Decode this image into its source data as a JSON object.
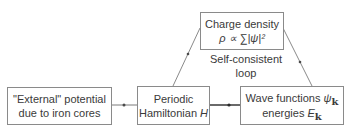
{
  "diagram": {
    "nodes": {
      "charge": {
        "line1": "Charge density",
        "line2": "ρ ∝ ∑|ψ|²"
      },
      "external": {
        "line1": "\"External\" potential",
        "line2": "due to iron cores"
      },
      "hamiltonian": {
        "line1": "Periodic",
        "line2_text": "Hamiltonian ",
        "line2_symbol": "H"
      },
      "wave": {
        "line1_text": "Wave functions ",
        "line1_symbol": "ψ",
        "line1_sub": "k",
        "line2_text": "energies ",
        "line2_symbol": "E",
        "line2_sub": "k"
      }
    },
    "loop_label": {
      "line1": "Self-consistent",
      "line2": "loop"
    },
    "edges": [
      {
        "from": "external",
        "to": "hamiltonian"
      },
      {
        "from": "hamiltonian",
        "to": "wave"
      },
      {
        "from": "wave",
        "to": "charge"
      },
      {
        "from": "charge",
        "to": "hamiltonian"
      }
    ],
    "colors": {
      "line": "#6a6a6a",
      "box_border": "#8a8a8a",
      "text": "#3a3a3a"
    }
  }
}
